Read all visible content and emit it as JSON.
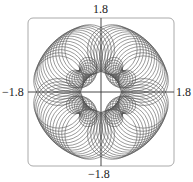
{
  "chart_data": {
    "type": "line",
    "title": "",
    "xlabel": "",
    "ylabel": "",
    "xlim": [
      -1.8,
      1.8
    ],
    "ylim": [
      -1.8,
      1.8
    ],
    "grid": false,
    "legend": null,
    "tick_labels": {
      "top": "1.8",
      "bottom": "-1.8",
      "left": "-1.8",
      "right": "1.8"
    },
    "colors": {
      "curve": "#555555",
      "axes": "#333333",
      "frame": "#999999"
    }
  },
  "labels": {
    "top": "1.8",
    "bottom": "−1.8",
    "left": "−1.8",
    "right": "1.8"
  }
}
